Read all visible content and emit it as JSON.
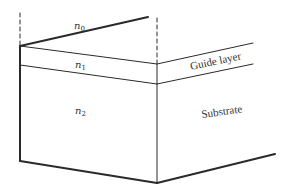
{
  "diagram": {
    "type": "layered-waveguide-perspective",
    "regions": [
      {
        "id": "cover",
        "index_symbol": "n",
        "index_subscript": "0"
      },
      {
        "id": "guide",
        "index_symbol": "n",
        "index_subscript": "1"
      },
      {
        "id": "substrate",
        "index_symbol": "n",
        "index_subscript": "2"
      }
    ],
    "labels": {
      "guide_layer": "Guide layer",
      "substrate": "Substrate"
    },
    "colors": {
      "line": "#2a2a2a",
      "background": "#ffffff"
    }
  }
}
